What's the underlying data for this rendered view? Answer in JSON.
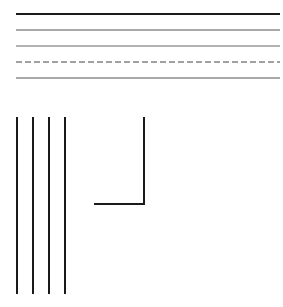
{
  "canvas": {
    "width": 283,
    "height": 307,
    "background": "#ffffff"
  },
  "horizontal_lines": [
    {
      "id": "h1",
      "x1": 16,
      "x2": 280,
      "y": 14,
      "width": 2,
      "style": "solid",
      "color": "#1a1a1a"
    },
    {
      "id": "h2",
      "x1": 16,
      "x2": 280,
      "y": 30,
      "width": 1,
      "style": "solid",
      "color": "#555555"
    },
    {
      "id": "h3",
      "x1": 16,
      "x2": 280,
      "y": 46,
      "width": 1,
      "style": "solid",
      "color": "#666666"
    },
    {
      "id": "h4",
      "x1": 16,
      "x2": 280,
      "y": 62,
      "width": 1,
      "style": "dashed",
      "dash": "6 3",
      "color": "#444444"
    },
    {
      "id": "h5",
      "x1": 16,
      "x2": 280,
      "y": 78,
      "width": 1,
      "style": "solid",
      "color": "#555555"
    }
  ],
  "vertical_lines": [
    {
      "id": "v1",
      "x": 17,
      "y1": 117,
      "y2": 294,
      "width": 2,
      "color": "#1a1a1a"
    },
    {
      "id": "v2",
      "x": 33,
      "y1": 117,
      "y2": 294,
      "width": 2,
      "color": "#1a1a1a"
    },
    {
      "id": "v3",
      "x": 49,
      "y1": 117,
      "y2": 294,
      "width": 2,
      "color": "#1a1a1a"
    },
    {
      "id": "v4",
      "x": 65,
      "y1": 117,
      "y2": 294,
      "width": 2,
      "color": "#1a1a1a"
    }
  ],
  "corner_shape": {
    "vertical": {
      "x": 144,
      "y1": 117,
      "y2": 205
    },
    "horizontal": {
      "x1": 94,
      "x2": 145,
      "y": 204
    },
    "width": 2,
    "color": "#1a1a1a"
  }
}
